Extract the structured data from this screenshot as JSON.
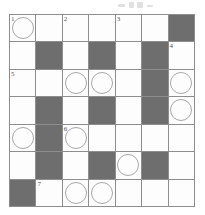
{
  "puzzle": {
    "kind": "crossword-grid",
    "columns": 7,
    "rows": 7,
    "colors": {
      "shaded_cell": "#6e6e6e",
      "open_cell": "#fdfdfd",
      "grid_line": "#8e8e8e",
      "circle_stroke": "#a8a8a8",
      "clue_number": "#55555a"
    },
    "legend": {
      "shaded_means": "blocked square",
      "circle_means": "highlighted letter square"
    },
    "clue_numbers": [
      "1",
      "2",
      "3",
      "4",
      "5",
      "6",
      "7"
    ],
    "cells": [
      [
        {
          "shaded": false,
          "circled": true,
          "number": "1"
        },
        {
          "shaded": false,
          "circled": false,
          "number": ""
        },
        {
          "shaded": false,
          "circled": false,
          "number": "2"
        },
        {
          "shaded": false,
          "circled": false,
          "number": ""
        },
        {
          "shaded": false,
          "circled": false,
          "number": "3"
        },
        {
          "shaded": false,
          "circled": false,
          "number": ""
        },
        {
          "shaded": true,
          "circled": false,
          "number": ""
        }
      ],
      [
        {
          "shaded": false,
          "circled": false,
          "number": ""
        },
        {
          "shaded": true,
          "circled": false,
          "number": ""
        },
        {
          "shaded": false,
          "circled": false,
          "number": ""
        },
        {
          "shaded": true,
          "circled": false,
          "number": ""
        },
        {
          "shaded": false,
          "circled": false,
          "number": ""
        },
        {
          "shaded": true,
          "circled": false,
          "number": ""
        },
        {
          "shaded": false,
          "circled": false,
          "number": "4"
        }
      ],
      [
        {
          "shaded": false,
          "circled": false,
          "number": "5"
        },
        {
          "shaded": false,
          "circled": false,
          "number": ""
        },
        {
          "shaded": false,
          "circled": true,
          "number": ""
        },
        {
          "shaded": false,
          "circled": true,
          "number": ""
        },
        {
          "shaded": false,
          "circled": false,
          "number": ""
        },
        {
          "shaded": true,
          "circled": false,
          "number": ""
        },
        {
          "shaded": false,
          "circled": true,
          "number": ""
        }
      ],
      [
        {
          "shaded": false,
          "circled": false,
          "number": ""
        },
        {
          "shaded": true,
          "circled": false,
          "number": ""
        },
        {
          "shaded": false,
          "circled": false,
          "number": ""
        },
        {
          "shaded": true,
          "circled": false,
          "number": ""
        },
        {
          "shaded": false,
          "circled": false,
          "number": ""
        },
        {
          "shaded": true,
          "circled": false,
          "number": ""
        },
        {
          "shaded": false,
          "circled": true,
          "number": ""
        }
      ],
      [
        {
          "shaded": false,
          "circled": true,
          "number": ""
        },
        {
          "shaded": true,
          "circled": false,
          "number": ""
        },
        {
          "shaded": false,
          "circled": true,
          "number": "6"
        },
        {
          "shaded": false,
          "circled": false,
          "number": ""
        },
        {
          "shaded": false,
          "circled": false,
          "number": ""
        },
        {
          "shaded": false,
          "circled": false,
          "number": ""
        },
        {
          "shaded": false,
          "circled": false,
          "number": ""
        }
      ],
      [
        {
          "shaded": false,
          "circled": false,
          "number": ""
        },
        {
          "shaded": true,
          "circled": false,
          "number": ""
        },
        {
          "shaded": false,
          "circled": false,
          "number": ""
        },
        {
          "shaded": true,
          "circled": false,
          "number": ""
        },
        {
          "shaded": false,
          "circled": true,
          "number": ""
        },
        {
          "shaded": true,
          "circled": false,
          "number": ""
        },
        {
          "shaded": false,
          "circled": false,
          "number": ""
        }
      ],
      [
        {
          "shaded": true,
          "circled": false,
          "number": ""
        },
        {
          "shaded": false,
          "circled": false,
          "number": "7"
        },
        {
          "shaded": false,
          "circled": true,
          "number": ""
        },
        {
          "shaded": false,
          "circled": true,
          "number": ""
        },
        {
          "shaded": false,
          "circled": false,
          "number": ""
        },
        {
          "shaded": false,
          "circled": false,
          "number": ""
        },
        {
          "shaded": false,
          "circled": false,
          "number": ""
        }
      ]
    ]
  }
}
